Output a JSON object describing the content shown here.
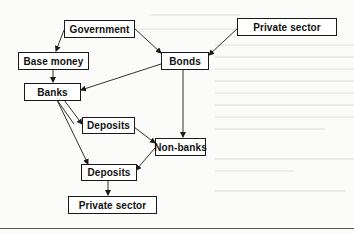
{
  "diagram": {
    "type": "flow",
    "nodes": [
      {
        "id": "government",
        "label": "Government"
      },
      {
        "id": "private_sector_top",
        "label": "Private sector"
      },
      {
        "id": "base_money",
        "label": "Base money"
      },
      {
        "id": "bonds",
        "label": "Bonds"
      },
      {
        "id": "banks",
        "label": "Banks"
      },
      {
        "id": "deposits_upper",
        "label": "Deposits"
      },
      {
        "id": "non_banks",
        "label": "Non-banks"
      },
      {
        "id": "deposits_lower",
        "label": "Deposits"
      },
      {
        "id": "private_sector_bottom",
        "label": "Private sector"
      }
    ],
    "edges": [
      {
        "from": "government",
        "to": "base_money"
      },
      {
        "from": "government",
        "to": "bonds"
      },
      {
        "from": "private_sector_top",
        "to": "bonds"
      },
      {
        "from": "base_money",
        "to": "banks"
      },
      {
        "from": "bonds",
        "to": "banks"
      },
      {
        "from": "bonds",
        "to": "non_banks"
      },
      {
        "from": "banks",
        "to": "deposits_upper"
      },
      {
        "from": "banks",
        "to": "deposits_lower"
      },
      {
        "from": "deposits_upper",
        "to": "non_banks"
      },
      {
        "from": "non_banks",
        "to": "deposits_lower"
      },
      {
        "from": "deposits_lower",
        "to": "private_sector_bottom"
      }
    ],
    "colors": {
      "line": "#1a1a1a",
      "box_fill": "#ffffff",
      "background": "#fbfbf9"
    }
  }
}
